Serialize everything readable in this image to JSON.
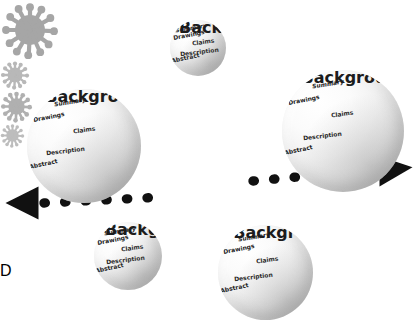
{
  "diagram": {
    "distance_label": "D",
    "background_color": "#ffffff",
    "sphere_text_color": "#1c1c1c",
    "decoration_color": "#a8a8a8",
    "watermark_text": ""
  },
  "sphere_terms": {
    "summary": "Summary",
    "drawings": "Drawings",
    "claims": "Claims",
    "description": "Description",
    "abstract": "Abstract",
    "background": "Background"
  },
  "spheres": [
    {
      "id": "sphere-left-primary",
      "role": "primary",
      "size_px": 114,
      "x": 27,
      "y": 89
    },
    {
      "id": "sphere-right-primary",
      "role": "primary",
      "size_px": 122,
      "x": 282,
      "y": 70
    },
    {
      "id": "sphere-top-small",
      "role": "secondary",
      "size_px": 56,
      "x": 170,
      "y": 20
    },
    {
      "id": "sphere-bottom-left",
      "role": "secondary",
      "size_px": 68,
      "x": 94,
      "y": 222
    },
    {
      "id": "sphere-bottom-right",
      "role": "secondary",
      "size_px": 95,
      "x": 218,
      "y": 225
    }
  ],
  "decorations": [
    {
      "id": "virus-top-left",
      "size_px": 60,
      "x": 57,
      "y": 12,
      "spikes": 12,
      "color": "#a6a6a6"
    },
    {
      "id": "virus-top-right",
      "size_px": 30,
      "x": 262,
      "y": 32,
      "spikes": 12,
      "color": "#b8b8b8"
    },
    {
      "id": "virus-middle",
      "size_px": 33,
      "x": 218,
      "y": 178,
      "spikes": 12,
      "color": "#b0b0b0"
    },
    {
      "id": "virus-bottom-left",
      "size_px": 25,
      "x": 10,
      "y": 222,
      "spikes": 12,
      "color": "#bdbdbd"
    }
  ],
  "connector": {
    "name": "distance-connector",
    "style": "dotted-double-arrow",
    "color": "#111111",
    "left_arrow_label": "arrow pointing to left sphere",
    "right_arrow_label": "arrow pointing to right sphere"
  }
}
